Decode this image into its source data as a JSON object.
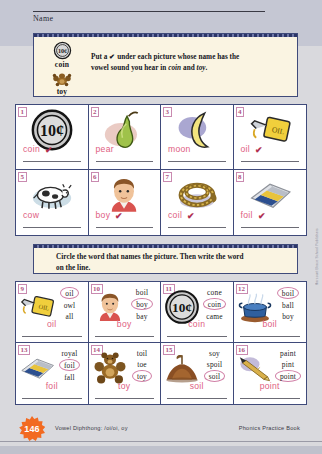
{
  "header": {
    "name_label": "Name",
    "cue_items": [
      {
        "word": "coin",
        "icon": "coin-icon"
      },
      {
        "word": "toy",
        "icon": "toy-bear-icon"
      }
    ],
    "directions_1_line1": "Put a ✔ under each picture whose name has the",
    "directions_1_line2_pre": "vowel sound you hear in ",
    "directions_1_word1": "coin",
    "directions_1_mid": " and ",
    "directions_1_word2": "toy",
    "directions_1_end": "."
  },
  "directions_2": {
    "line1": "Circle the word that names the picture. Then write the word",
    "line2": "on the line."
  },
  "part1": {
    "items": [
      {
        "number": "1",
        "word": "coin",
        "icon": "coin-icon",
        "checked": true
      },
      {
        "number": "2",
        "word": "pear",
        "icon": "pear-icon",
        "checked": false
      },
      {
        "number": "3",
        "word": "moon",
        "icon": "moon-icon",
        "checked": false
      },
      {
        "number": "4",
        "word": "oil",
        "icon": "oil-can-icon",
        "checked": true
      },
      {
        "number": "5",
        "word": "cow",
        "icon": "cow-icon",
        "checked": false
      },
      {
        "number": "6",
        "word": "boy",
        "icon": "boy-icon",
        "checked": true
      },
      {
        "number": "7",
        "word": "coil",
        "icon": "coil-rope-icon",
        "checked": true
      },
      {
        "number": "8",
        "word": "foil",
        "icon": "foil-icon",
        "checked": true
      }
    ]
  },
  "part2": {
    "items": [
      {
        "number": "9",
        "icon": "oil-can-icon",
        "options": [
          "oil",
          "owl",
          "all"
        ],
        "selected": "oil",
        "answer": "oil"
      },
      {
        "number": "10",
        "icon": "boy-icon",
        "options": [
          "boil",
          "boy",
          "bay"
        ],
        "selected": "boy",
        "answer": "boy"
      },
      {
        "number": "11",
        "icon": "coin-icon",
        "options": [
          "cone",
          "coin",
          "came"
        ],
        "selected": "coin",
        "answer": "coin"
      },
      {
        "number": "12",
        "icon": "boiling-pot-icon",
        "options": [
          "boil",
          "ball",
          "boy"
        ],
        "selected": "boil",
        "answer": "boil"
      },
      {
        "number": "13",
        "icon": "foil-icon",
        "options": [
          "royal",
          "foil",
          "fall"
        ],
        "selected": "foil",
        "answer": "foil"
      },
      {
        "number": "14",
        "icon": "toy-bear-icon",
        "options": [
          "toil",
          "toe",
          "toy"
        ],
        "selected": "toy",
        "answer": "toy"
      },
      {
        "number": "15",
        "icon": "soil-pile-icon",
        "options": [
          "soy",
          "spoil",
          "soil"
        ],
        "selected": "soil",
        "answer": "soil"
      },
      {
        "number": "16",
        "icon": "pencil-point-icon",
        "options": [
          "paint",
          "pint",
          "point"
        ],
        "selected": "point",
        "answer": "point"
      }
    ]
  },
  "footer": {
    "page_number": "146",
    "skill_label": "Vowel Diphthong:  /oi/oi, oy",
    "book_label": "Phonics Practice Book",
    "vertical_copyright": "Harcourt Brace School Publishers"
  },
  "colors": {
    "box_border": "#3f4a7a",
    "box_fill": "#faf4e2",
    "answer_pink": "#e0607f",
    "circle_pink": "#d07fa6",
    "check_red": "#b03050",
    "page_badge": "#f26a21"
  }
}
